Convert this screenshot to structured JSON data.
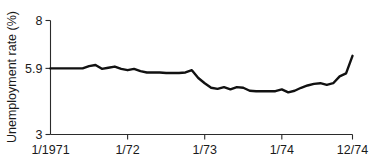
{
  "chart_data": {
    "type": "line",
    "title": "",
    "subtitle": "",
    "xlabel": "",
    "ylabel": "Unemployment rate (%)",
    "grid": false,
    "legend": false,
    "legend_position": "none",
    "line_color": "#111111",
    "axis_color": "#2b2b2b",
    "background": "#ffffff",
    "xlim": [
      0,
      47
    ],
    "ylim": [
      3,
      8
    ],
    "y_ticks": [
      3,
      5.9,
      8
    ],
    "y_tick_labels": [
      "3",
      "5.9",
      "8"
    ],
    "x_ticks": [
      0,
      12,
      24,
      36,
      47
    ],
    "x_tick_labels": [
      "1/1971",
      "1/72",
      "1/73",
      "1/74",
      "12/74"
    ],
    "x_unit": "month index from January 1971",
    "series": [
      {
        "name": "Unemployment rate",
        "x": [
          0,
          1,
          2,
          3,
          4,
          5,
          6,
          7,
          8,
          9,
          10,
          11,
          12,
          13,
          14,
          15,
          16,
          17,
          18,
          19,
          20,
          21,
          22,
          23,
          24,
          25,
          26,
          27,
          28,
          29,
          30,
          31,
          32,
          33,
          34,
          35,
          36,
          37,
          38,
          39,
          40,
          41,
          42,
          43,
          44,
          45,
          46,
          47
        ],
        "values": [
          5.9,
          5.9,
          5.9,
          5.9,
          5.9,
          5.9,
          6.0,
          6.05,
          5.88,
          5.93,
          5.98,
          5.88,
          5.82,
          5.88,
          5.78,
          5.72,
          5.72,
          5.72,
          5.7,
          5.7,
          5.7,
          5.72,
          5.82,
          5.48,
          5.25,
          5.05,
          5.0,
          5.08,
          4.98,
          5.08,
          5.05,
          4.92,
          4.9,
          4.9,
          4.9,
          4.9,
          4.98,
          4.85,
          4.92,
          5.05,
          5.15,
          5.22,
          5.25,
          5.18,
          5.25,
          5.55,
          5.68,
          6.45
        ]
      }
    ]
  },
  "axis": {
    "y_label": "Unemployment rate (%)"
  }
}
